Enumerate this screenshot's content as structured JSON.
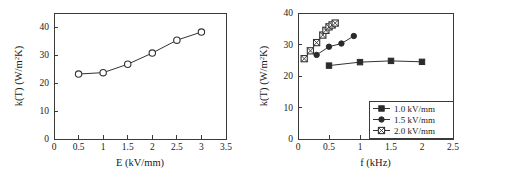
{
  "figure": {
    "background": "#ffffff",
    "line_color": "#333333",
    "axis_color": "#3a3a3a"
  },
  "chart_data": [
    {
      "id": "left",
      "type": "line",
      "title": "",
      "xlabel": "E  (kV/mm)",
      "ylabel": "k(T)  (W/m2K)",
      "ylabel_parts": {
        "prefix": "k(T)  (W/m",
        "superscript": "2",
        "suffix": "K)"
      },
      "xlim": [
        0,
        3.5
      ],
      "ylim": [
        0,
        45
      ],
      "xticks": [
        0,
        0.5,
        1,
        1.5,
        2,
        2.5,
        3,
        3.5
      ],
      "xticklabels": [
        "0",
        "0.5",
        "1",
        "1.5",
        "2",
        "2.5",
        "3",
        "3.5"
      ],
      "yticks": [
        0,
        10,
        20,
        30,
        40
      ],
      "yticklabels": [
        "0",
        "10",
        "20",
        "30",
        "40"
      ],
      "grid": false,
      "legend": null,
      "series": [
        {
          "name": "k(T) vs E",
          "marker": "open-circle",
          "x": [
            0.5,
            1.0,
            1.5,
            2.0,
            2.5,
            3.0
          ],
          "values": [
            23.2,
            23.7,
            26.7,
            30.7,
            35.3,
            38.2
          ]
        }
      ]
    },
    {
      "id": "right",
      "type": "line",
      "title": "",
      "xlabel": "f  (kHz)",
      "ylabel": "k(T)  (W/m2K)",
      "ylabel_parts": {
        "prefix": "k(T)  (W/m",
        "superscript": "2",
        "suffix": "K)"
      },
      "xlim": [
        0,
        2.5
      ],
      "ylim": [
        0,
        40
      ],
      "xticks": [
        0,
        0.5,
        1,
        1.5,
        2,
        2.5
      ],
      "xticklabels": [
        "0",
        "0.5",
        "1",
        "1.5",
        "2",
        "2.5"
      ],
      "yticks": [
        0,
        10,
        20,
        30,
        40
      ],
      "yticklabels": [
        "0",
        "10",
        "20",
        "30",
        "40"
      ],
      "grid": false,
      "legend_position": "lower-right",
      "series": [
        {
          "name": "1.0 kV/mm",
          "marker": "filled-square",
          "x": [
            0.5,
            1.0,
            1.5,
            2.0
          ],
          "values": [
            23.3,
            24.4,
            24.8,
            24.5
          ]
        },
        {
          "name": "1.5 kV/mm",
          "marker": "filled-circle",
          "x": [
            0.3,
            0.5,
            0.7,
            0.9
          ],
          "values": [
            26.7,
            29.3,
            30.3,
            32.7
          ]
        },
        {
          "name": "2.0 kV/mm",
          "marker": "crossed-square",
          "x": [
            0.1,
            0.2,
            0.3,
            0.4,
            0.45,
            0.5,
            0.55,
            0.6
          ],
          "values": [
            25.5,
            28.0,
            30.6,
            33.0,
            34.5,
            35.6,
            36.2,
            36.8
          ]
        }
      ]
    }
  ]
}
